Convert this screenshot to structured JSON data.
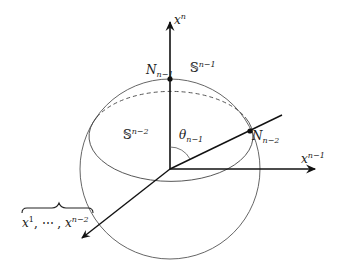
{
  "diagram": {
    "colors": {
      "background": "#ffffff",
      "axis": "#111111",
      "sphere": "#444444",
      "text": "#1a1a1a"
    },
    "axes": {
      "vertical": {
        "label_base": "x",
        "label_sup": "n"
      },
      "horizontal": {
        "label_base": "x",
        "label_sup": "n−1"
      },
      "diagonal_label": {
        "base1": "x",
        "sup1": "1",
        "sep": ", ⋯ , ",
        "base2": "x",
        "sup2": "n−2"
      }
    },
    "points": [
      {
        "name": "N",
        "sub": "n−1",
        "role": "north-pole"
      },
      {
        "name": "N",
        "sub": "n−2",
        "role": "equator-point"
      }
    ],
    "sphere_labels": {
      "outer": {
        "base": "𝕊",
        "sup": "n−1"
      },
      "inner": {
        "base": "𝕊",
        "sup": "n−2"
      }
    },
    "angle": {
      "base": "θ",
      "sub": "n−1"
    }
  }
}
